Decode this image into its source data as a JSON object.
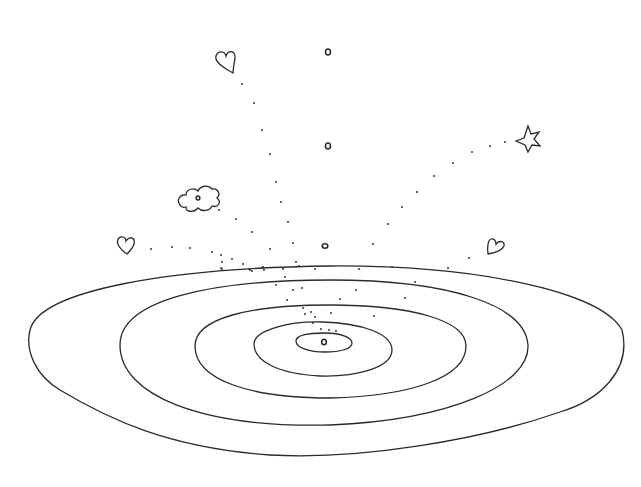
{
  "artwork": {
    "description": "Hand-drawn line sketch of concentric wobbly ellipses with dotted trails leading to doodles",
    "stroke_color": "#2a2a2a",
    "background": "#ffffff",
    "doodles": [
      {
        "kind": "heart-icon",
        "x": 225,
        "y": 63
      },
      {
        "kind": "heart-icon",
        "x": 126,
        "y": 244
      },
      {
        "kind": "heart-icon",
        "x": 495,
        "y": 246
      },
      {
        "kind": "star-icon",
        "x": 527,
        "y": 139
      },
      {
        "kind": "flower-icon",
        "x": 198,
        "y": 197
      }
    ],
    "small_circles": [
      {
        "x": 328,
        "y": 52
      },
      {
        "x": 328,
        "y": 146
      },
      {
        "x": 325,
        "y": 246
      },
      {
        "x": 324,
        "y": 341
      }
    ],
    "ellipses": [
      {
        "cx": 325,
        "cy": 345,
        "rx": 298,
        "ry": 110
      },
      {
        "cx": 330,
        "cy": 346,
        "rx": 199,
        "ry": 82
      },
      {
        "cx": 330,
        "cy": 347,
        "rx": 136,
        "ry": 58
      },
      {
        "cx": 322,
        "cy": 346,
        "rx": 70,
        "ry": 38
      },
      {
        "cx": 325,
        "cy": 342,
        "rx": 27,
        "ry": 10
      }
    ]
  }
}
